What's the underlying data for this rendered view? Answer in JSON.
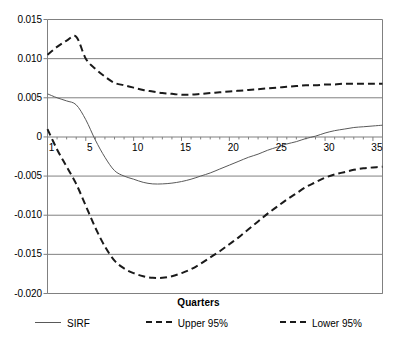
{
  "chart_data": {
    "type": "line",
    "title": "",
    "xlabel": "Quarters",
    "ylabel": "",
    "xlim": [
      1,
      36
    ],
    "ylim": [
      -0.02,
      0.015
    ],
    "grid": true,
    "legend_position": "bottom",
    "x": [
      1,
      2,
      3,
      4,
      5,
      6,
      7,
      8,
      9,
      10,
      11,
      12,
      13,
      14,
      15,
      16,
      17,
      18,
      19,
      20,
      21,
      22,
      23,
      24,
      25,
      26,
      27,
      28,
      29,
      30,
      31,
      32,
      33,
      34,
      35,
      36
    ],
    "y_ticks": [
      0.015,
      0.01,
      0.005,
      0,
      -0.005,
      -0.01,
      -0.015,
      -0.02
    ],
    "y_tick_labels": [
      "0.015",
      "0.010",
      "0.005",
      "0",
      "-0.005",
      "-0.010",
      "-0.015",
      "-0.020"
    ],
    "x_ticks": [
      1,
      5,
      10,
      15,
      20,
      25,
      30,
      35
    ],
    "x_tick_labels": [
      "1",
      "5",
      "10",
      "15",
      "20",
      "25",
      "30",
      "35"
    ],
    "series": [
      {
        "name": "SIRF",
        "style": "solid",
        "color": "#595959",
        "values": [
          0.0055,
          0.005,
          0.0046,
          0.0041,
          0.0022,
          -0.0004,
          -0.0026,
          -0.0043,
          -0.005,
          -0.0054,
          -0.0058,
          -0.006,
          -0.006,
          -0.0059,
          -0.0057,
          -0.0054,
          -0.005,
          -0.0046,
          -0.0041,
          -0.0036,
          -0.0031,
          -0.0026,
          -0.0022,
          -0.0017,
          -0.0013,
          -0.0009,
          -0.0006,
          -0.0002,
          0.0001,
          0.0005,
          0.0008,
          0.001,
          0.0012,
          0.0013,
          0.0014,
          0.0015
        ]
      },
      {
        "name": "Upper 95%",
        "style": "dashed",
        "color": "#1a1a1a",
        "values": [
          0.0105,
          0.0115,
          0.0123,
          0.0128,
          0.01,
          0.0087,
          0.0077,
          0.0069,
          0.0066,
          0.0063,
          0.006,
          0.0058,
          0.0056,
          0.0055,
          0.0054,
          0.0054,
          0.0055,
          0.0056,
          0.0057,
          0.0058,
          0.0059,
          0.006,
          0.0061,
          0.0062,
          0.0063,
          0.0064,
          0.0065,
          0.0066,
          0.0066,
          0.0067,
          0.0067,
          0.0068,
          0.0068,
          0.0068,
          0.0068,
          0.0068
        ]
      },
      {
        "name": "Lower 95%",
        "style": "dashed",
        "color": "#1a1a1a",
        "values": [
          0.001,
          -0.0016,
          -0.0038,
          -0.006,
          -0.0088,
          -0.0116,
          -0.014,
          -0.0158,
          -0.0168,
          -0.0174,
          -0.0178,
          -0.018,
          -0.018,
          -0.0178,
          -0.0174,
          -0.0169,
          -0.0162,
          -0.0154,
          -0.0146,
          -0.0137,
          -0.0128,
          -0.0118,
          -0.0108,
          -0.0098,
          -0.0089,
          -0.008,
          -0.0072,
          -0.0064,
          -0.0058,
          -0.0052,
          -0.0048,
          -0.0045,
          -0.0042,
          -0.004,
          -0.0039,
          -0.0038
        ]
      }
    ]
  },
  "axis": {
    "x_title": "Quarters"
  },
  "legend": {
    "items": [
      {
        "label": "SIRF"
      },
      {
        "label": "Upper 95%"
      },
      {
        "label": "Lower 95%"
      }
    ]
  },
  "colors": {
    "solid_line": "#595959",
    "dashed_line": "#1a1a1a",
    "gridline": "#808080",
    "axis": "#808080",
    "background": "#ffffff"
  }
}
